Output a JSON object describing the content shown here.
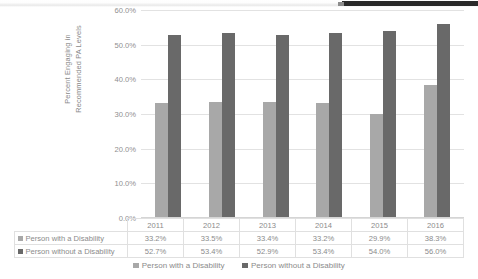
{
  "chart_data": {
    "type": "bar",
    "title": "",
    "xlabel": "",
    "ylabel": "Percent Engaging in Recommended PA Levels",
    "ylabel_line1": "Percent Engaging in",
    "ylabel_line2": "Recommended PA Levels",
    "categories": [
      "2011",
      "2012",
      "2013",
      "2014",
      "2015",
      "2016"
    ],
    "series": [
      {
        "name": "Person with a Disability",
        "color": "#a8a8a8",
        "values": [
          33.2,
          33.5,
          33.4,
          33.2,
          29.9,
          38.3
        ],
        "labels": [
          "33.2%",
          "33.5%",
          "33.4%",
          "33.2%",
          "29.9%",
          "38.3%"
        ]
      },
      {
        "name": "Person without a Disability",
        "color": "#696969",
        "values": [
          52.7,
          53.4,
          52.9,
          53.4,
          54.0,
          56.0
        ],
        "labels": [
          "52.7%",
          "53.4%",
          "52.9%",
          "53.4%",
          "54.0%",
          "56.0%"
        ]
      }
    ],
    "ylim": [
      0,
      60
    ],
    "ytick_values": [
      60,
      50,
      40,
      30,
      20,
      10,
      0
    ],
    "ytick_labels": [
      "60.0%",
      "50.0%",
      "40.0%",
      "30.0%",
      "20.0%",
      "10.0%",
      "0.0%"
    ],
    "grid": true,
    "legend_position": "bottom",
    "data_table_visible": true
  },
  "legend": {
    "items": [
      {
        "label": "Person with a Disability",
        "color": "#a8a8a8"
      },
      {
        "label": "Person without a Disability",
        "color": "#696969"
      }
    ]
  },
  "colors": {
    "series_light": "#a8a8a8",
    "series_dark": "#696969",
    "gridline": "#e2e2e2",
    "text": "#8b8b8b",
    "table_border": "#e0e0e0"
  }
}
